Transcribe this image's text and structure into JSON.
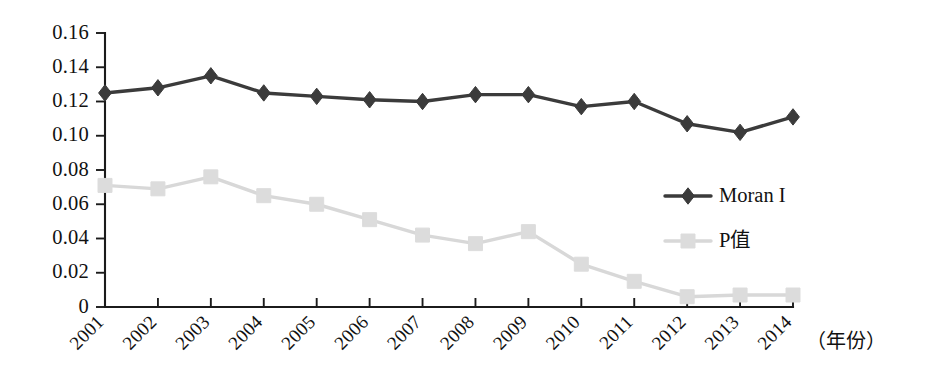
{
  "chart_data": {
    "type": "line",
    "title": "",
    "subtitle": "",
    "xlabel": "（年份）",
    "ylabel": "",
    "categories": [
      "2001",
      "2002",
      "2003",
      "2004",
      "2005",
      "2006",
      "2007",
      "2008",
      "2009",
      "2010",
      "2011",
      "2012",
      "2013",
      "2014"
    ],
    "series": [
      {
        "name": "Moran I",
        "marker": "diamond",
        "color": "#3b3b3b",
        "values": [
          0.125,
          0.128,
          0.135,
          0.125,
          0.123,
          0.121,
          0.12,
          0.124,
          0.124,
          0.117,
          0.12,
          0.107,
          0.102,
          0.111
        ]
      },
      {
        "name": "P值",
        "marker": "square",
        "color": "#dcdcdc",
        "values": [
          0.071,
          0.069,
          0.076,
          0.065,
          0.06,
          0.051,
          0.042,
          0.037,
          0.044,
          0.025,
          0.015,
          0.006,
          0.007,
          0.007
        ]
      }
    ],
    "ylim": [
      0,
      0.16
    ],
    "yticks": [
      0,
      0.02,
      0.04,
      0.06,
      0.08,
      0.1,
      0.12,
      0.14,
      0.16
    ],
    "ytick_labels": [
      "0",
      "0.02",
      "0.04",
      "0.06",
      "0.08",
      "0.10",
      "0.12",
      "0.14",
      "0.16"
    ],
    "grid": false,
    "legend_position": "center-right",
    "x_tick_rotation_deg": 45
  },
  "legend": {
    "entries": [
      {
        "label": "Moran I",
        "marker": "diamond",
        "color": "#3b3b3b"
      },
      {
        "label": "P值",
        "marker": "square",
        "color": "#dcdcdc"
      }
    ]
  },
  "axis": {
    "x_caption": "（年份）"
  },
  "colors": {
    "axis": "#1b1b1b",
    "text": "#111111",
    "moran": "#3b3b3b",
    "pvalue": "#dcdcdc",
    "background": "#ffffff"
  }
}
